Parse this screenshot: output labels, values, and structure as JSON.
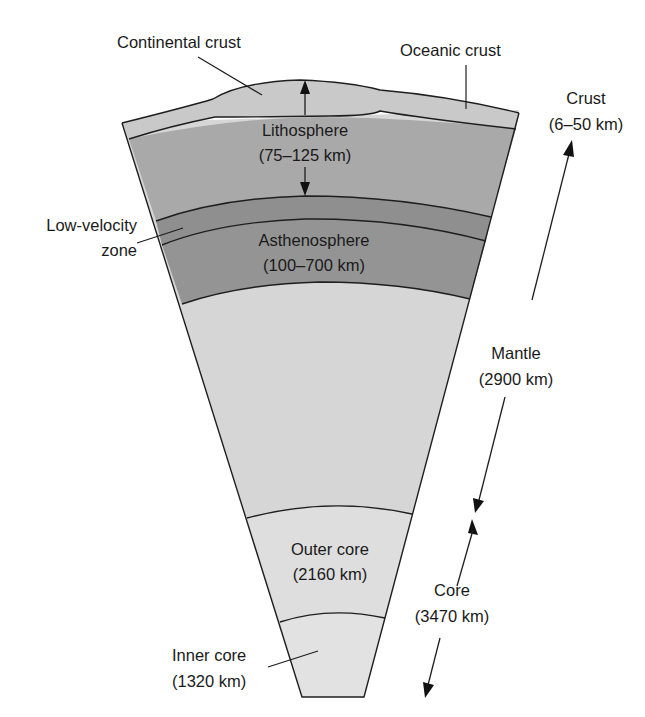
{
  "diagram": {
    "colors": {
      "crust": "#c9c9c9",
      "lithosphere": "#a9a9a9",
      "low_velocity_zone": "#8f8f8f",
      "asthenosphere": "#939393",
      "mantle": "#d6d6d6",
      "outer_core": "#dedede",
      "inner_core": "#e2e2e2",
      "outline": "#1e1e1e",
      "background": "#ffffff"
    },
    "labels": {
      "continental_crust": "Continental crust",
      "oceanic_crust": "Oceanic crust",
      "lithosphere": "Lithosphere",
      "lithosphere_range": "(75–125 km)",
      "low_velocity_line1": "Low-velocity",
      "low_velocity_line2": "zone",
      "asthenosphere": "Asthenosphere",
      "asthenosphere_range": "(100–700 km)",
      "crust": "Crust",
      "crust_range": "(6–50 km)",
      "mantle": "Mantle",
      "mantle_range": "(2900 km)",
      "outer_core": "Outer core",
      "outer_core_range": "(2160 km)",
      "core": "Core",
      "core_range": "(3470 km)",
      "inner_core": "Inner core",
      "inner_core_range": "(1320 km)"
    }
  }
}
